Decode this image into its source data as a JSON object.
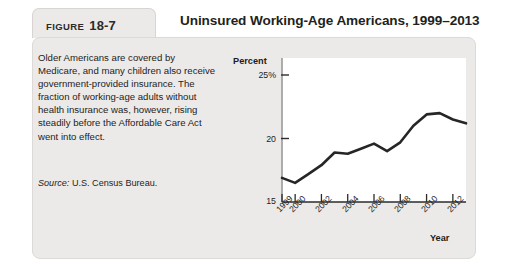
{
  "figure": {
    "tab_word": "FIGURE",
    "tab_number": "18-7",
    "title": "Uninsured Working-Age Americans, 1999–2013"
  },
  "caption": {
    "body": "Older Americans are covered by Medicare, and many children also receive government-provided insurance. The fraction of working-age adults without health insurance was, however, rising steadily before the Affordable Care Act went into effect.",
    "source_label": "Source:",
    "source_text": "U.S. Census Bureau."
  },
  "chart_data": {
    "type": "line",
    "title": "Uninsured Working-Age Americans, 1999–2013",
    "xlabel": "Year",
    "ylabel": "Percent",
    "ylim": [
      15,
      25
    ],
    "xlim": [
      1999,
      2013
    ],
    "grid": false,
    "legend": null,
    "ytick_labels": [
      "25%",
      "20",
      "15"
    ],
    "ytick_values": [
      25,
      20,
      15
    ],
    "xtick_labels": [
      "1999",
      "2000",
      "2002",
      "2004",
      "2006",
      "2008",
      "2010",
      "2012"
    ],
    "xtick_values": [
      1999,
      2000,
      2002,
      2004,
      2006,
      2008,
      2010,
      2012
    ],
    "x": [
      1999,
      2000,
      2001,
      2002,
      2003,
      2004,
      2005,
      2006,
      2007,
      2008,
      2009,
      2010,
      2011,
      2012,
      2013
    ],
    "values": [
      16.9,
      16.5,
      17.2,
      17.9,
      18.9,
      18.8,
      19.2,
      19.6,
      19.0,
      19.7,
      21.0,
      21.9,
      22.0,
      21.5,
      21.2
    ],
    "line_color": "#262626",
    "plot_background": "#ffffff"
  },
  "colors": {
    "panel": "#eceae8",
    "tab": "#eceae8",
    "text": "#1d1d1d"
  }
}
